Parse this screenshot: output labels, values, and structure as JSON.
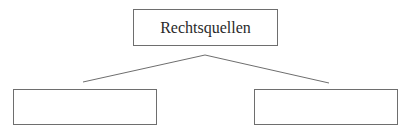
{
  "diagram": {
    "type": "tree",
    "root": {
      "label": "Rechtsquellen"
    },
    "children": [
      {
        "label": ""
      },
      {
        "label": ""
      }
    ],
    "colors": {
      "border": "#6e6e6e",
      "line": "#6e6e6e",
      "text": "#2a2a2a",
      "background": "#ffffff"
    }
  }
}
